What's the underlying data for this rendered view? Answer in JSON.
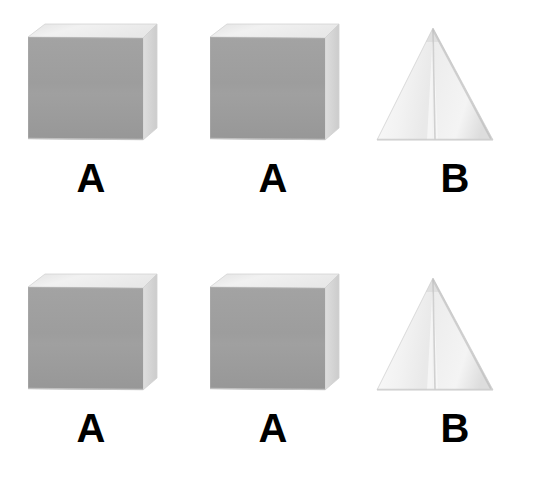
{
  "scene": {
    "background_color": "#ffffff",
    "width": 546,
    "height": 479,
    "description": "Two-by-three grid of photographed three-dimensional blocks with printed letter labels"
  },
  "palette": {
    "cube_front": "#9b9b9b",
    "cube_front_light": "#a5a5a5",
    "cube_top": "#eeeeee",
    "cube_right": "#d8d8d8",
    "cube_edge": "#c9c9c9",
    "pyramid_left": "#f3f3f3",
    "pyramid_right": "#ededed",
    "pyramid_ridge": "#b4b4b4",
    "pyramid_edge": "#cfcfcf",
    "label_color": "#000000"
  },
  "grid": {
    "rows": 2,
    "columns": 3,
    "cells": [
      {
        "row": 1,
        "column": 1,
        "shape": "cube",
        "label": "A"
      },
      {
        "row": 1,
        "column": 2,
        "shape": "cube",
        "label": "A"
      },
      {
        "row": 1,
        "column": 3,
        "shape": "pyramid",
        "label": "B"
      },
      {
        "row": 2,
        "column": 1,
        "shape": "cube",
        "label": "A"
      },
      {
        "row": 2,
        "column": 2,
        "shape": "cube",
        "label": "A"
      },
      {
        "row": 2,
        "column": 3,
        "shape": "pyramid",
        "label": "B"
      }
    ]
  }
}
